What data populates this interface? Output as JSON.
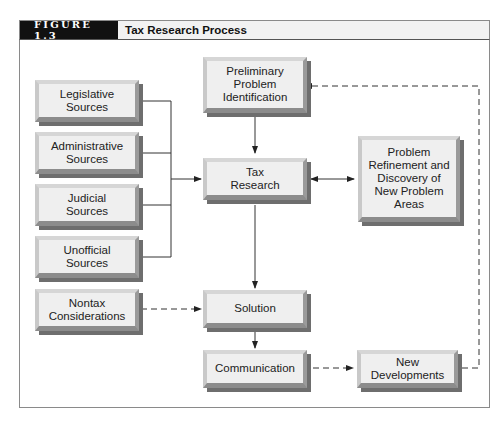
{
  "figure": {
    "label": "FIGURE 1.3",
    "title": "Tax Research Process"
  },
  "nodes": {
    "preliminary": {
      "lines": [
        "Preliminary",
        "Problem",
        "Identification"
      ]
    },
    "legislative": {
      "lines": [
        "Legislative",
        "Sources"
      ]
    },
    "administrative": {
      "lines": [
        "Administrative",
        "Sources"
      ]
    },
    "judicial": {
      "lines": [
        "Judicial",
        "Sources"
      ]
    },
    "unofficial": {
      "lines": [
        "Unofficial",
        "Sources"
      ]
    },
    "nontax": {
      "lines": [
        "Nontax",
        "Considerations"
      ]
    },
    "tax_research": {
      "lines": [
        "Tax",
        "Research"
      ]
    },
    "refinement": {
      "lines": [
        "Problem",
        "Refinement and",
        "Discovery of",
        "New Problem",
        "Areas"
      ]
    },
    "solution": {
      "lines": [
        "Solution"
      ]
    },
    "communication": {
      "lines": [
        "Communication"
      ]
    },
    "new_developments": {
      "lines": [
        "New",
        "Developments"
      ]
    }
  },
  "edges": [
    {
      "from": "legislative",
      "to": "tax_research",
      "style": "solid"
    },
    {
      "from": "administrative",
      "to": "tax_research",
      "style": "solid"
    },
    {
      "from": "judicial",
      "to": "tax_research",
      "style": "solid"
    },
    {
      "from": "unofficial",
      "to": "tax_research",
      "style": "solid"
    },
    {
      "from": "preliminary",
      "to": "tax_research",
      "style": "solid"
    },
    {
      "from": "tax_research",
      "to": "refinement",
      "style": "solid",
      "bidirectional": true
    },
    {
      "from": "tax_research",
      "to": "solution",
      "style": "solid"
    },
    {
      "from": "nontax",
      "to": "solution",
      "style": "dashed"
    },
    {
      "from": "solution",
      "to": "communication",
      "style": "solid"
    },
    {
      "from": "communication",
      "to": "new_developments",
      "style": "dashed"
    },
    {
      "from": "new_developments",
      "to": "preliminary",
      "style": "dashed"
    }
  ],
  "colors": {
    "label_bg": "#111111",
    "title_bg": "#f2f2f2",
    "box_face": "#efefef",
    "line": "#333333"
  }
}
